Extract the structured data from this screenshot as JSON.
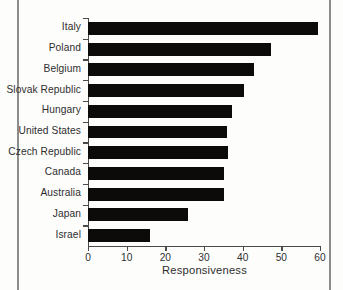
{
  "chart_data": {
    "type": "bar",
    "orientation": "horizontal",
    "title": "",
    "xlabel": "Responsiveness",
    "ylabel": "",
    "xlim": [
      0,
      60
    ],
    "xticks": [
      0,
      10,
      20,
      30,
      40,
      50,
      60
    ],
    "xtick_labels": [
      "0",
      "10",
      "20",
      "30",
      "40",
      "50",
      "60"
    ],
    "grid": false,
    "legend": null,
    "bar_color": "#0d0b0a",
    "axis_color": "#4a4a4a",
    "categories": [
      "Italy",
      "Poland",
      "Belgium",
      "Slovak Republic",
      "Hungary",
      "United States",
      "Czech Republic",
      "Canada",
      "Australia",
      "Japan",
      "Israel"
    ],
    "values": [
      59.5,
      47.3,
      43.0,
      40.3,
      37.2,
      36.0,
      36.2,
      35.1,
      35.1,
      25.8,
      16.0
    ]
  }
}
